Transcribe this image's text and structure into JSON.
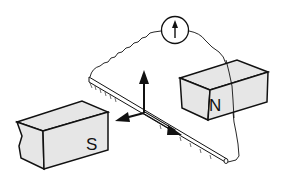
{
  "diagram": {
    "labels": {
      "north_magnet": "N",
      "south_magnet": "S"
    },
    "components": [
      "galvanometer",
      "conducting-rod",
      "rail",
      "north-magnet",
      "south-magnet",
      "force-arrows",
      "wire"
    ],
    "colors": {
      "stroke": "#111111",
      "magnet_fill": "#e6e6e6",
      "background": "#ffffff"
    }
  }
}
